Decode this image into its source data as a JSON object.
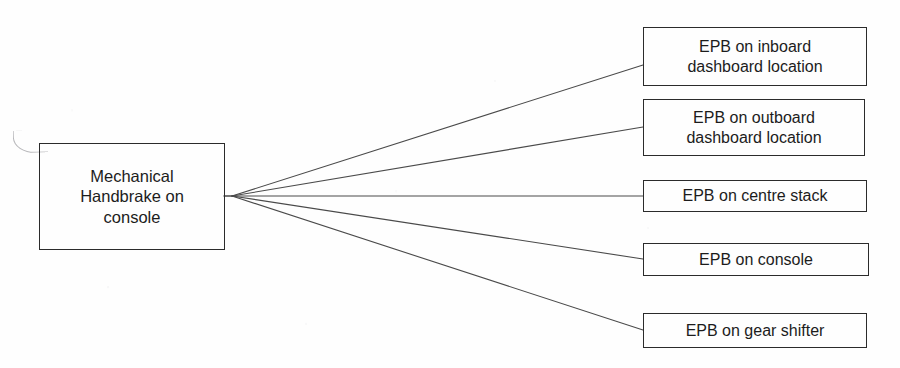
{
  "diagram": {
    "type": "fan-out-tree",
    "title": "",
    "background_color": "#fefefe",
    "line_color": "#4a4a4a",
    "border_color": "#2b2b2b",
    "text_color": "#1c1c1c",
    "source": {
      "id": "source-node",
      "label": "Mechanical\nHandbrake on\nconsole",
      "shape": "rectangle"
    },
    "targets": [
      {
        "id": "target-node-0",
        "label": "EPB on inboard\ndashboard location",
        "shape": "rectangle"
      },
      {
        "id": "target-node-1",
        "label": "EPB on outboard\ndashboard location",
        "shape": "rectangle"
      },
      {
        "id": "target-node-2",
        "label": "EPB on centre stack",
        "shape": "rectangle"
      },
      {
        "id": "target-node-3",
        "label": "EPB on console",
        "shape": "rectangle"
      },
      {
        "id": "target-node-4",
        "label": "EPB on gear shifter",
        "shape": "rectangle"
      }
    ],
    "connectors": [
      {
        "from": "source-node",
        "to": "target-node-0",
        "style": "straight-line"
      },
      {
        "from": "source-node",
        "to": "target-node-1",
        "style": "straight-line"
      },
      {
        "from": "source-node",
        "to": "target-node-2",
        "style": "straight-line"
      },
      {
        "from": "source-node",
        "to": "target-node-3",
        "style": "straight-line"
      },
      {
        "from": "source-node",
        "to": "target-node-4",
        "style": "straight-line"
      }
    ]
  }
}
